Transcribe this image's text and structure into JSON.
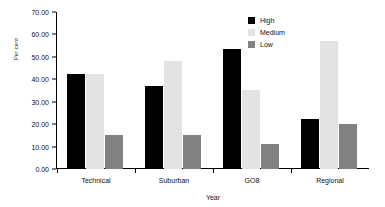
{
  "chart_data": {
    "type": "bar",
    "title": "",
    "xlabel": "Year",
    "ylabel": "Per cent",
    "categories": [
      "Technical",
      "Suburban",
      "GO8",
      "Regional"
    ],
    "series": [
      {
        "name": "High",
        "color": "#000000",
        "values": [
          42.5,
          37.0,
          53.5,
          22.3
        ]
      },
      {
        "name": "Medium",
        "color": "#e3e3e3",
        "values": [
          42.3,
          48.3,
          35.3,
          57.2
        ]
      },
      {
        "name": "Low",
        "color": "#828282",
        "values": [
          15.2,
          15.2,
          11.2,
          20.0
        ]
      }
    ],
    "ylim": [
      0,
      70
    ],
    "ytick_step": 10,
    "ytick_labels": [
      "70.00",
      "60.00",
      "50.00",
      "40.00",
      "30.00",
      "20.00",
      "10.00",
      "0.00"
    ],
    "ytick_values": [
      70,
      60,
      50,
      40,
      30,
      20,
      10,
      0
    ],
    "grid": false,
    "legend_position": "top-right"
  },
  "axis": {
    "y_title": "Per cent",
    "x_title": "Year"
  },
  "legend": {
    "items": [
      {
        "label": "High",
        "color": "#000000"
      },
      {
        "label": "Medium",
        "color": "#e3e3e3"
      },
      {
        "label": "Low",
        "color": "#828282"
      }
    ]
  }
}
